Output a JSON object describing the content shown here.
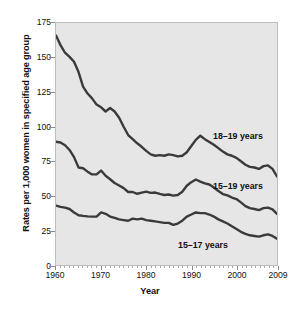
{
  "chart_data": {
    "type": "line",
    "title": "",
    "xlabel": "Year",
    "ylabel": "Rates per 1,000 women in specified age group",
    "xlim": [
      1960,
      2009
    ],
    "ylim": [
      0,
      175
    ],
    "yticks": [
      0,
      25,
      50,
      75,
      100,
      125,
      150,
      175
    ],
    "xticks": [
      1960,
      1970,
      1980,
      1990,
      2000,
      2009
    ],
    "grid": false,
    "legend_position": "inline-right-annotations",
    "line_color": "#3a3a3a",
    "plot_background": "#e6e6e6",
    "x": [
      1960,
      1961,
      1962,
      1963,
      1964,
      1965,
      1966,
      1967,
      1968,
      1969,
      1970,
      1971,
      1972,
      1973,
      1974,
      1975,
      1976,
      1977,
      1978,
      1979,
      1980,
      1981,
      1982,
      1983,
      1984,
      1985,
      1986,
      1987,
      1988,
      1989,
      1990,
      1991,
      1992,
      1993,
      1994,
      1995,
      1996,
      1997,
      1998,
      1999,
      2000,
      2001,
      2002,
      2003,
      2004,
      2005,
      2006,
      2007,
      2008,
      2009
    ],
    "series": [
      {
        "name": "18–19 years",
        "values": [
          166.0,
          159.0,
          153.5,
          150.5,
          147.0,
          139.5,
          129.0,
          124.0,
          120.5,
          116.0,
          114.0,
          111.0,
          113.5,
          111.0,
          106.5,
          100.0,
          94.0,
          91.0,
          88.0,
          85.5,
          82.5,
          80.0,
          79.0,
          79.5,
          79.0,
          80.0,
          79.5,
          78.5,
          79.0,
          81.5,
          86.0,
          90.5,
          93.5,
          91.0,
          89.0,
          87.0,
          84.5,
          82.0,
          80.0,
          79.0,
          77.5,
          75.0,
          72.5,
          71.0,
          70.5,
          69.5,
          71.5,
          72.0,
          69.5,
          64.0
        ]
      },
      {
        "name": "15–19 years",
        "values": [
          89.1,
          88.6,
          86.6,
          83.2,
          78.0,
          70.5,
          70.0,
          67.5,
          65.5,
          65.5,
          68.3,
          64.5,
          62.0,
          59.3,
          57.5,
          55.6,
          52.8,
          52.8,
          51.5,
          52.3,
          53.0,
          52.2,
          52.4,
          51.4,
          50.6,
          51.0,
          50.2,
          50.6,
          53.0,
          57.3,
          59.9,
          61.8,
          60.3,
          59.0,
          58.2,
          56.0,
          53.5,
          51.3,
          50.3,
          48.8,
          47.7,
          45.3,
          42.6,
          41.1,
          40.5,
          39.7,
          41.1,
          41.5,
          40.2,
          37.0
        ]
      },
      {
        "name": "15–17 years",
        "values": [
          43.0,
          42.0,
          41.5,
          40.5,
          38.0,
          36.0,
          35.5,
          35.2,
          35.0,
          35.0,
          38.0,
          37.0,
          35.0,
          34.0,
          33.0,
          32.5,
          32.0,
          33.5,
          33.0,
          33.5,
          32.5,
          32.0,
          31.5,
          31.0,
          30.5,
          30.5,
          29.0,
          30.0,
          32.0,
          35.0,
          36.5,
          38.0,
          37.5,
          37.5,
          36.5,
          35.0,
          33.0,
          31.5,
          30.0,
          28.0,
          26.0,
          24.0,
          22.5,
          21.5,
          21.0,
          20.5,
          21.5,
          22.2,
          21.0,
          19.0
        ]
      }
    ],
    "annotations": [
      {
        "text": "18–19 years",
        "x_px": 213,
        "y_px": 131
      },
      {
        "text": "15–19 years",
        "x_px": 213,
        "y_px": 181
      },
      {
        "text": "15–17 years",
        "x_px": 178,
        "y_px": 240
      }
    ]
  }
}
